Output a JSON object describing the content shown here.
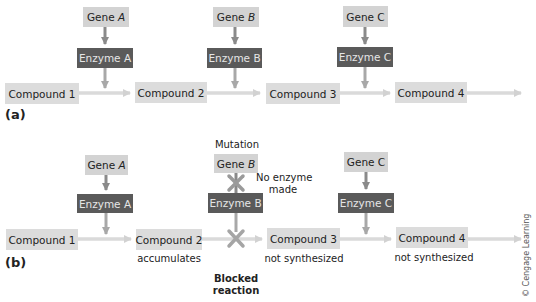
{
  "colors": {
    "gene_box": "#d3d3d3",
    "enzyme_box": "#5a5a5a",
    "compound_box": "#dcdcdc",
    "pathway_arrow": "#d8d8d8",
    "gene_arrow": "#8a8a8a",
    "block_x": "#9a9a9a"
  },
  "panel_a": {
    "label": "(a)",
    "genes": [
      {
        "prefix": "Gene ",
        "letter": "A"
      },
      {
        "prefix": "Gene ",
        "letter": "B"
      },
      {
        "prefix": "Gene ",
        "letter": "C"
      }
    ],
    "enzymes": [
      "Enzyme A",
      "Enzyme B",
      "Enzyme C"
    ],
    "compounds": [
      "Compound 1",
      "Compound 2",
      "Compound 3",
      "Compound 4"
    ]
  },
  "panel_b": {
    "label": "(b)",
    "mutation_label": "Mutation",
    "genes": [
      {
        "prefix": "Gene ",
        "letter": "A"
      },
      {
        "prefix": "Gene ",
        "letter": "B"
      },
      {
        "prefix": "Gene ",
        "letter": "C"
      }
    ],
    "no_enzyme_line1": "No enzyme",
    "no_enzyme_line2": "made",
    "enzymes": [
      "Enzyme A",
      "Enzyme B",
      "Enzyme C"
    ],
    "compounds": [
      "Compound 1",
      "Compound 2",
      "Compound 3",
      "Compound 4"
    ],
    "compound_notes": [
      "",
      "accumulates",
      "not synthesized",
      "not synthesized"
    ],
    "blocked_line1": "Blocked",
    "blocked_line2": "reaction"
  },
  "copyright": "© Cengage Learning"
}
